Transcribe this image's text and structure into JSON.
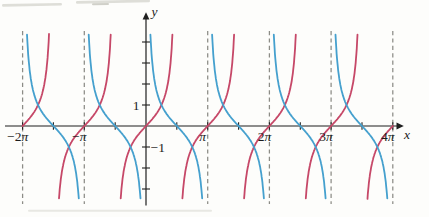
{
  "page": {
    "width": 429,
    "height": 217,
    "paper_bg": "#fdfdfb"
  },
  "figure": {
    "axis_color": "#1f1f1f",
    "label_color": "#1c1c1c",
    "grid_dash_color": "#8c8c86",
    "x_axis_label": "x",
    "y_axis_label": "y",
    "x_tick_labels": [
      {
        "text": "−2π",
        "t": -2
      },
      {
        "text": "−π",
        "t": -1
      },
      {
        "text": "π",
        "t": 1
      },
      {
        "text": "2π",
        "t": 2
      },
      {
        "text": "3π",
        "t": 3
      },
      {
        "text": "4π",
        "t": 4
      }
    ],
    "y_tick_labels": [
      {
        "text": "1",
        "v": 1,
        "side": "left"
      },
      {
        "text": "−1",
        "v": -1,
        "side": "right"
      }
    ]
  },
  "chart_data": {
    "type": "line",
    "title": "",
    "xlabel": "x",
    "ylabel": "y",
    "x_range_pi": [
      -2,
      4
    ],
    "y_clip": [
      -3.62,
      4.48
    ],
    "x_tick_step_pi": 0.5,
    "y_ticks": [
      -3,
      -2,
      -1,
      1,
      2,
      3,
      4
    ],
    "asymptotes_pi": [
      -2,
      -1,
      1,
      2,
      3,
      4
    ],
    "grid": "off",
    "legend": "none",
    "series": [
      {
        "name": "y = tan x",
        "fn": "tan",
        "color": "#c64868",
        "zero_crossings_pi": [
          -2,
          -1,
          0,
          1,
          2,
          3,
          4
        ],
        "branch_breaks_pi": [
          -2,
          -1.5,
          -0.5,
          0.5,
          1.5,
          2.5,
          3.5,
          4
        ]
      },
      {
        "name": "y = cot x",
        "fn": "cot",
        "color": "#45a0ce",
        "zero_crossings_pi": [
          -1.5,
          -0.5,
          0.5,
          1.5,
          2.5,
          3.5
        ],
        "branch_breaks_pi": [
          -2,
          -1,
          0,
          1,
          2,
          3,
          4
        ]
      }
    ]
  },
  "artifacts": {
    "top_smudge_color": "#d7d7d0",
    "top_smudge_dark": "#c6c6bd",
    "bottom_smudge_color": "#e8e8e3"
  }
}
